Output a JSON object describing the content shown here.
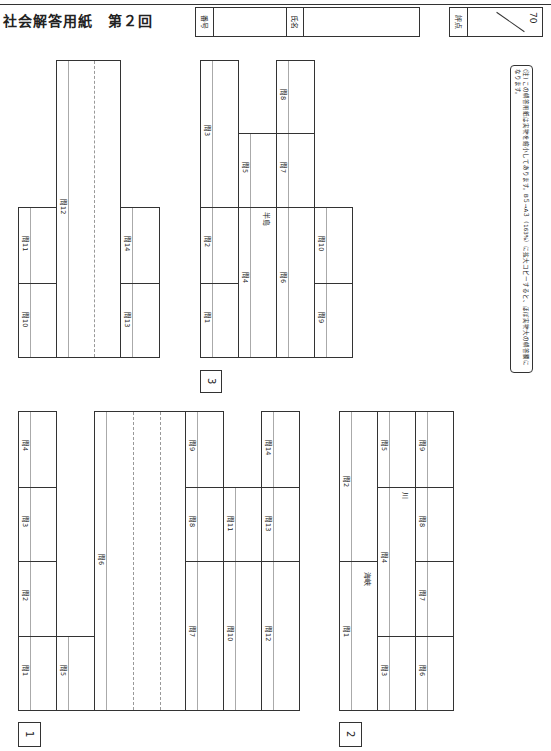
{
  "header": {
    "title": "社会解答用紙　第２回",
    "number_label": "番号",
    "name_label": "氏名",
    "score_label": "評点",
    "score_max": "70"
  },
  "note": "(注) この解答用紙は実物を縮小してあります。B５→A３（163%）に拡大コピーすると、ほぼ実物大の解答欄になります。",
  "sections": {
    "s1": {
      "marker": "1",
      "q1": "問1",
      "q2": "問2",
      "q3": "問3",
      "q4": "問4",
      "q5": "問5",
      "q6": "問6",
      "q7": "問7",
      "q8": "問8",
      "q9": "問9",
      "q10": "問10",
      "q11": "問11",
      "q12": "問12",
      "q13": "問13",
      "q14": "問14"
    },
    "s2": {
      "marker": "2",
      "q1": "問1",
      "q2": "問2",
      "q3": "問3",
      "q4": "問4",
      "q5": "問5",
      "q6": "問6",
      "q7": "問7",
      "q8": "問8",
      "q9": "問9",
      "strait": "海峡",
      "river": "川"
    },
    "s3": {
      "marker": "3",
      "q1": "問1",
      "q2": "問2",
      "q3": "問3",
      "q4": "問4",
      "q5": "問5",
      "q6": "問6",
      "q7": "問7",
      "q8": "問8",
      "q9": "問9",
      "q10": "問10",
      "peninsula": "半島"
    }
  }
}
